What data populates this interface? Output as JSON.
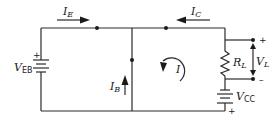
{
  "diagram": {
    "type": "circuit",
    "sources": {
      "veb": {
        "symbol": "V",
        "subscript": "EB",
        "plus": "+"
      },
      "vcc": {
        "symbol": "V",
        "subscript": "CC",
        "plus": "+"
      }
    },
    "currents": {
      "ie": {
        "symbol": "I",
        "subscript": "E",
        "direction": "right"
      },
      "ic": {
        "symbol": "I",
        "subscript": "C",
        "direction": "left"
      },
      "ib": {
        "symbol": "I",
        "subscript": "B",
        "direction": "up"
      },
      "loop": {
        "symbol": "I",
        "direction": "counterclockwise"
      }
    },
    "resistor": {
      "symbol": "R",
      "subscript": "L"
    },
    "load_voltage": {
      "symbol": "V",
      "subscript": "L",
      "plus": "+",
      "minus": "–"
    },
    "colors": {
      "line": "#2a2a2a",
      "background": "#ffffff"
    }
  }
}
